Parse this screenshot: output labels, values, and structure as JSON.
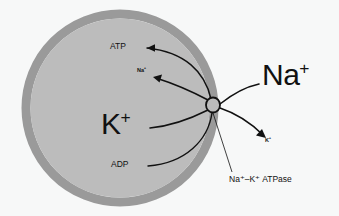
{
  "diagram": {
    "type": "biological-schematic",
    "background_color": "#f7f8f8",
    "cell": {
      "membrane_color": "#9a9a9a",
      "cytoplasm_color": "#bcbcbc",
      "center_x": 120,
      "center_y": 108,
      "radius": 98,
      "membrane_thickness": 9
    },
    "pump": {
      "label": "Na⁺–K⁺ ATPase",
      "symbol": "circle",
      "x": 213,
      "y": 105,
      "rx": 7,
      "ry": 7.5,
      "stroke_color": "#111111"
    },
    "labels": {
      "atp": {
        "text": "ATP",
        "size": "small",
        "location": "intracellular-upper"
      },
      "adp": {
        "text": "ADP",
        "size": "small",
        "location": "intracellular-lower"
      },
      "na_intracellular": {
        "base": "Na",
        "charge": "+",
        "size": "tiny",
        "location": "intracellular-upper"
      },
      "na_extracellular": {
        "base": "Na",
        "charge": "+",
        "size": "large",
        "location": "extracellular-upper-right"
      },
      "k_intracellular": {
        "base": "K",
        "charge": "+",
        "size": "large",
        "location": "intracellular-middle"
      },
      "k_extracellular": {
        "base": "K",
        "charge": "+",
        "size": "tiny",
        "location": "extracellular-lower-right"
      },
      "pump_caption": {
        "text": "Na⁺–K⁺ ATPase",
        "size": "small",
        "location": "below-right"
      }
    },
    "arrows": [
      {
        "name": "atp-consumption",
        "from": "pump",
        "to": "ATP",
        "direction": "up-left",
        "arrowhead": true
      },
      {
        "name": "adp-production",
        "from": "pump",
        "to": "ADP",
        "direction": "down-left",
        "arrowhead": false
      },
      {
        "name": "sodium-efflux",
        "from": "intracellular Na+",
        "to": "extracellular Na+",
        "direction": "up-left-inbound",
        "arrowhead": true
      },
      {
        "name": "sodium-entry-to-pump",
        "from": "extracellular Na+",
        "to": "pump",
        "direction": "left",
        "arrowhead": false
      },
      {
        "name": "potassium-influx",
        "from": "pump",
        "to": "intracellular K+",
        "direction": "down-left",
        "arrowhead": false
      },
      {
        "name": "potassium-outward",
        "from": "pump",
        "to": "extracellular K+",
        "direction": "down-right",
        "arrowhead": true
      }
    ],
    "leader_line": {
      "name": "pump-caption-leader",
      "from": "pump",
      "to": "pump-caption"
    }
  }
}
